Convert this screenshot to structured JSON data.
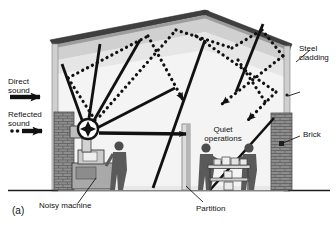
{
  "figure": {
    "caption": "(a)"
  },
  "legend": {
    "direct": {
      "line1": "Direct",
      "line2": "sound",
      "style": "solid-arrow"
    },
    "reflected": {
      "line1": "Reflected",
      "line2": "sound",
      "style": "dotted-arrow"
    }
  },
  "labels": {
    "steel_cladding": {
      "line1": "Steel",
      "line2": "cladding"
    },
    "brick": "Brick",
    "quiet_operations": {
      "line1": "Quiet",
      "line2": "operations"
    },
    "partition": "Partition",
    "noisy_machine": "Noisy machine"
  },
  "colors": {
    "ink": "#111111",
    "roof_dark": "#4a4a4a",
    "wall_light": "#f2f2f2",
    "wall_shade": "#d8d8d8",
    "roof_shade": "#b9b9b9",
    "brick": "#8d8d8d",
    "brick_dark": "#6f6f6f",
    "figure_gray": "#7a7a7a",
    "machine_gray": "#9a9a9a",
    "ground": "#2a2a2a"
  },
  "icons": {
    "direct_arrow": "solid-arrow-icon",
    "reflected_arrow": "dotted-arrow-icon",
    "sound_source": "sound-source-icon"
  }
}
